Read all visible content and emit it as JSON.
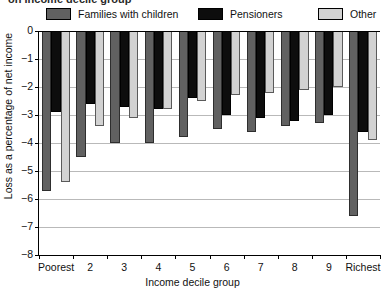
{
  "title_partial": "on income decile group",
  "legend": {
    "position": "top",
    "items": [
      {
        "label": "Families with children",
        "color": "#616161",
        "icon": "legend-swatch"
      },
      {
        "label": "Pensioners",
        "color": "#0d0d0d",
        "icon": "legend-swatch"
      },
      {
        "label": "Other",
        "color": "#d2d2d2",
        "icon": "legend-swatch"
      }
    ]
  },
  "axes": {
    "ylabel": "Loss as a percentage of net income",
    "xlabel": "Income decile group",
    "yticks": [
      "0",
      "-1",
      "-2",
      "-3",
      "-4",
      "-5",
      "-6",
      "-7",
      "-8"
    ],
    "ylim": [
      -8,
      0
    ],
    "grid": true
  },
  "chart_data": {
    "type": "bar",
    "title": "on income decile group",
    "xlabel": "Income decile group",
    "ylabel": "Loss as a percentage of net income",
    "ylim": [
      -8,
      0
    ],
    "yticks": [
      0,
      -1,
      -2,
      -3,
      -4,
      -5,
      -6,
      -7,
      -8
    ],
    "grid": true,
    "legend_position": "top",
    "categories": [
      "Poorest",
      "2",
      "3",
      "4",
      "5",
      "6",
      "7",
      "8",
      "9",
      "Richest"
    ],
    "series": [
      {
        "name": "Families with children",
        "color": "#616161",
        "values": [
          -5.7,
          -4.5,
          -4.0,
          -4.0,
          -3.8,
          -3.5,
          -3.6,
          -3.4,
          -3.3,
          -6.6
        ]
      },
      {
        "name": "Pensioners",
        "color": "#0d0d0d",
        "values": [
          -2.9,
          -2.6,
          -2.7,
          -2.8,
          -2.4,
          -3.0,
          -3.1,
          -3.2,
          -3.0,
          -3.6
        ]
      },
      {
        "name": "Other",
        "color": "#d2d2d2",
        "values": [
          -5.4,
          -3.4,
          -3.1,
          -2.8,
          -2.5,
          -2.3,
          -2.2,
          -2.1,
          -2.0,
          -3.9
        ]
      }
    ]
  }
}
